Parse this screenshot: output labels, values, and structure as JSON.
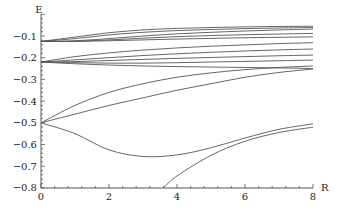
{
  "chart_data": {
    "type": "line",
    "title": "",
    "xlabel": "R",
    "ylabel": "E",
    "xlim": [
      0,
      8
    ],
    "ylim": [
      -0.8,
      -0.05
    ],
    "grid": false,
    "legend": null,
    "x_ticks": [
      0,
      2,
      4,
      6,
      8
    ],
    "y_ticks": [
      -0.1,
      -0.2,
      -0.3,
      -0.4,
      -0.5,
      -0.6,
      -0.7,
      -0.8
    ],
    "x_tick_labels": [
      "0",
      "2",
      "4",
      "6",
      "8"
    ],
    "y_tick_labels": [
      "-0.1",
      "-0.2",
      "-0.3",
      "-0.4",
      "-0.5",
      "-0.6",
      "-0.7",
      "-0.8"
    ],
    "x": [
      0,
      1,
      2,
      3,
      4,
      5,
      6,
      7,
      8
    ],
    "series": [
      {
        "name": "curve-1",
        "values": [
          -0.125,
          -0.105,
          -0.085,
          -0.072,
          -0.065,
          -0.061,
          -0.058,
          -0.056,
          -0.055
        ]
      },
      {
        "name": "curve-2",
        "values": [
          -0.125,
          -0.112,
          -0.095,
          -0.083,
          -0.075,
          -0.07,
          -0.066,
          -0.063,
          -0.061
        ]
      },
      {
        "name": "curve-3",
        "values": [
          -0.125,
          -0.122,
          -0.112,
          -0.1,
          -0.09,
          -0.083,
          -0.077,
          -0.072,
          -0.068
        ]
      },
      {
        "name": "curve-4",
        "values": [
          -0.125,
          -0.124,
          -0.118,
          -0.11,
          -0.103,
          -0.098,
          -0.094,
          -0.091,
          -0.088
        ]
      },
      {
        "name": "curve-5",
        "values": [
          -0.125,
          -0.125,
          -0.122,
          -0.118,
          -0.114,
          -0.111,
          -0.108,
          -0.106,
          -0.104
        ]
      },
      {
        "name": "curve-6",
        "values": [
          -0.22,
          -0.195,
          -0.178,
          -0.165,
          -0.155,
          -0.147,
          -0.141,
          -0.135,
          -0.131
        ]
      },
      {
        "name": "curve-7",
        "values": [
          -0.22,
          -0.21,
          -0.2,
          -0.19,
          -0.182,
          -0.175,
          -0.169,
          -0.164,
          -0.16
        ]
      },
      {
        "name": "curve-8",
        "values": [
          -0.22,
          -0.218,
          -0.213,
          -0.208,
          -0.203,
          -0.199,
          -0.195,
          -0.191,
          -0.188
        ]
      },
      {
        "name": "curve-9",
        "values": [
          -0.22,
          -0.223,
          -0.225,
          -0.225,
          -0.223,
          -0.22,
          -0.217,
          -0.214,
          -0.211
        ]
      },
      {
        "name": "curve-10",
        "values": [
          -0.22,
          -0.228,
          -0.234,
          -0.238,
          -0.241,
          -0.243,
          -0.245,
          -0.247,
          -0.25
        ]
      },
      {
        "name": "curve-11",
        "values": [
          -0.5,
          -0.42,
          -0.36,
          -0.32,
          -0.29,
          -0.27,
          -0.255,
          -0.245,
          -0.238
        ]
      },
      {
        "name": "curve-12",
        "values": [
          -0.5,
          -0.46,
          -0.42,
          -0.385,
          -0.35,
          -0.32,
          -0.29,
          -0.268,
          -0.252
        ]
      },
      {
        "name": "curve-13",
        "values": [
          -0.5,
          -0.55,
          -0.625,
          -0.655,
          -0.648,
          -0.615,
          -0.57,
          -0.53,
          -0.505
        ]
      },
      {
        "name": "curve-14",
        "x": [
          3.6,
          4,
          5,
          6,
          7,
          8
        ],
        "values": [
          -0.8,
          -0.745,
          -0.65,
          -0.585,
          -0.545,
          -0.52
        ]
      }
    ]
  }
}
